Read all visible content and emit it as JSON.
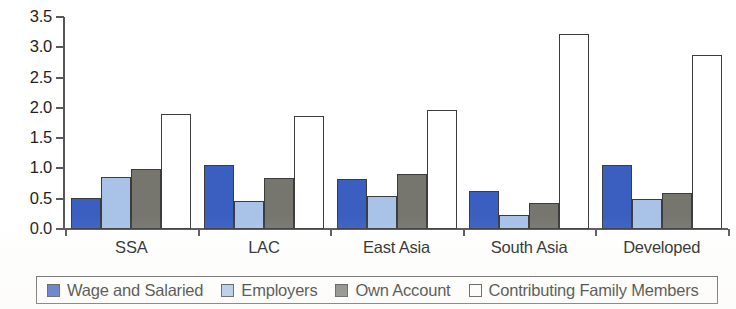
{
  "chart_data": {
    "type": "bar",
    "title": "",
    "subtitle": "",
    "xlabel": "",
    "ylabel": "",
    "categories": [
      "SSA",
      "LAC",
      "East Asia",
      "South Asia",
      "Developed"
    ],
    "series": [
      {
        "name": "Wage and Salaried",
        "color": "#3a5fc0",
        "values": [
          0.51,
          1.06,
          0.83,
          0.63,
          1.05
        ]
      },
      {
        "name": "Employers",
        "color": "#a8c2e8",
        "values": [
          0.86,
          0.47,
          0.54,
          0.23,
          0.49
        ]
      },
      {
        "name": "Own Account",
        "color": "#76766f",
        "values": [
          0.99,
          0.85,
          0.9,
          0.43,
          0.6
        ]
      },
      {
        "name": "Contributing Family Members",
        "color": "#ffffff",
        "values": [
          1.9,
          1.87,
          1.96,
          3.22,
          2.87
        ]
      }
    ],
    "ylim": [
      0.0,
      3.5
    ],
    "ytick_labels": [
      "0.0",
      "0.5",
      "1.0",
      "1.5",
      "2.0",
      "2.5",
      "3.0",
      "3.5"
    ],
    "ytick_values": [
      0.0,
      0.5,
      1.0,
      1.5,
      2.0,
      2.5,
      3.0,
      3.5
    ],
    "grid": false,
    "legend_position": "bottom",
    "axis_color": "#58585b",
    "bar_outline_color": "#3c3c3c"
  }
}
